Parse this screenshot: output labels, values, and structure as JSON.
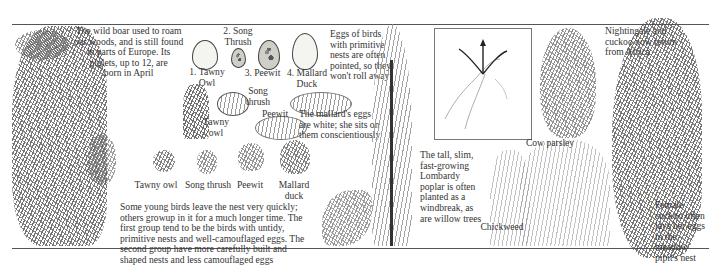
{
  "page": {
    "type": "illustrated nature spread",
    "palette": {
      "ink": "#2a2a2a",
      "paper": "#ffffff",
      "rule": "#555555"
    }
  },
  "captions": {
    "wild_boar": "The wild boar used to roam\nour woods, and is still found\nin parts of Europe. Its\npiglets, up to 12, are\nborn in April",
    "eggs_note": "Eggs of birds\nwith primitive\nnests are often\npointed, so they\nwon't roll away",
    "mallard_note": "The mallard's eggs\nare white; she sits on\nthem conscientiously",
    "young_birds": "Some young birds leave the nest very quickly;\nothers growup in it for a much longer time. The\nfirst group tend to be the birds with untidy,\nprimitive nests and well-camouflaged eggs. The\nsecond group have more carefully built and\nshaped nests and less camouflaged eggs",
    "poplar": "The tall, slim,\nfast-growing\nLombardy\npoplar is often\nplanted as a\nwindbreak, as\nare willow trees",
    "migration": "Nightingale and\ncuckoo now return\nfrom Africa",
    "cuckoo": "Female\ncuckoo often\nlays her eggs\nin the meadow\npipit's nest"
  },
  "eggs": [
    {
      "label": "1. Tawny\nOwl"
    },
    {
      "label": "2. Song\nThrush"
    },
    {
      "label": "3. Peewit"
    },
    {
      "label": "4. Mallard\nDuck"
    }
  ],
  "nests": [
    {
      "label": "Song\nthrush"
    },
    {
      "label": "Tawny\nowl"
    },
    {
      "label": "Peewit"
    }
  ],
  "chicks": [
    {
      "label": "Tawny owl"
    },
    {
      "label": "Song thrush"
    },
    {
      "label": "Peewit"
    },
    {
      "label": "Mallard\nduck"
    }
  ],
  "plants": {
    "cow_parsley": "Cow parsley",
    "chickweed": "Chickweed"
  }
}
